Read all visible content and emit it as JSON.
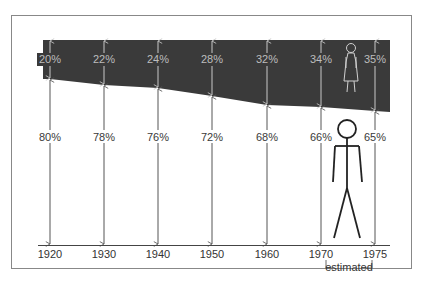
{
  "chart_data": {
    "type": "area",
    "title": "",
    "xlabel": "",
    "ylabel": "",
    "categories": [
      "1920",
      "1930",
      "1940",
      "1950",
      "1960",
      "1970",
      "1975"
    ],
    "series": [
      {
        "name": "Women",
        "values": [
          20,
          22,
          24,
          28,
          32,
          34,
          35
        ],
        "labels": [
          "20%",
          "22%",
          "24%",
          "28%",
          "32%",
          "34%",
          "35%"
        ],
        "color": "#3a3a3a"
      },
      {
        "name": "Men",
        "values": [
          80,
          78,
          76,
          72,
          68,
          66,
          65
        ],
        "labels": [
          "80%",
          "78%",
          "76%",
          "72%",
          "68%",
          "66%",
          "65%"
        ],
        "color": "#ffffff"
      }
    ],
    "stacked": true,
    "ylim": [
      0,
      100
    ],
    "annotations": [
      {
        "text": "estimated",
        "span": [
          "1970",
          "1975"
        ]
      },
      {
        "text": "female-figure-icon",
        "region": "Women"
      },
      {
        "text": "male-figure-icon",
        "region": "Men"
      }
    ],
    "grid": false,
    "legend": "none"
  },
  "labels": {
    "estimated": "estimated"
  }
}
